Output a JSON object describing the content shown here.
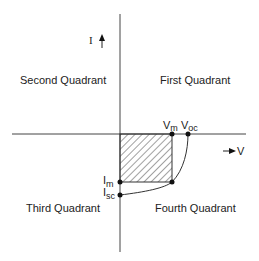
{
  "diagram": {
    "axes": {
      "current_label": "I",
      "voltage_label": "V"
    },
    "quadrants": {
      "first": "First Quadrant",
      "second": "Second Quadrant",
      "third": "Third Quadrant",
      "fourth": "Fourth Quadrant"
    },
    "points": {
      "vm": {
        "main": "V",
        "sub": "m"
      },
      "voc": {
        "main": "V",
        "sub": "oc"
      },
      "im": {
        "main": "I",
        "sub": "m"
      },
      "isc": {
        "main": "I",
        "sub": "sc"
      }
    },
    "max_power_region": "hatched rectangle (Vm × Im)",
    "colors": {
      "line": "#333333",
      "text": "#222222"
    }
  }
}
